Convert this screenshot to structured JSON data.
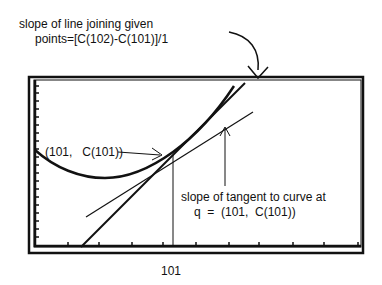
{
  "annotations": {
    "secant_line1": "slope of line joining given",
    "secant_line2": "points=[C(102)-C(101)]/1",
    "point_label": "(101,   C(101))",
    "tangent_line1": "slope of tangent to curve at",
    "tangent_line2": "q  =  (101,  C(101))",
    "x_tick_label": "101"
  },
  "colors": {
    "ink": "#111111",
    "background": "#ffffff"
  }
}
